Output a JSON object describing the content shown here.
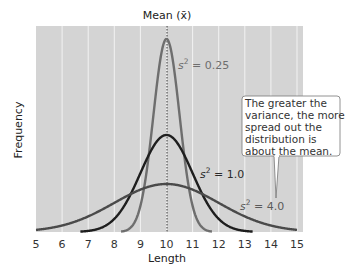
{
  "chart_data": {
    "type": "line",
    "title": "",
    "xlabel": "Length",
    "ylabel": "Frequency",
    "xlim": [
      5,
      15
    ],
    "xticks": [
      5,
      6,
      7,
      8,
      9,
      10,
      11,
      12,
      13,
      14,
      15
    ],
    "grid": {
      "vertical": true,
      "horizontal": false
    },
    "mean_line": {
      "x": 10,
      "label": "Mean (x̄)"
    },
    "series": [
      {
        "name": "s² = 0.25",
        "mean": 10,
        "variance": 0.25,
        "color": "#6e6e6e",
        "label_x": 11.0,
        "label_y_frac": 0.86
      },
      {
        "name": "s² = 1.0",
        "mean": 10,
        "variance": 1.0,
        "color": "#1e1e1e",
        "label_x": 11.7,
        "label_y_frac": 0.32
      },
      {
        "name": "s² = 4.0",
        "mean": 10,
        "variance": 4.0,
        "color": "#4a4a4a",
        "label_x": 13.2,
        "label_y_frac": 0.12
      }
    ],
    "annotations": [
      {
        "text": "The greater the variance, the more spread out the distribution is about the mean.",
        "pointer_to": "s² = 4.0"
      }
    ]
  },
  "labels": {
    "mean": "Mean (x̄)",
    "xlabel": "Length",
    "ylabel": "Frequency",
    "s025_prefix": "s",
    "s025_value": " = 0.25",
    "s1_prefix": "s",
    "s1_value": " = 1.0",
    "s4_prefix": "s",
    "s4_value": " = 4.0",
    "sup": "2",
    "callout_lines": [
      "The greater the",
      "variance, the more",
      "spread out the",
      "distribution is",
      "about the mean."
    ]
  },
  "ticks": [
    "5",
    "6",
    "7",
    "8",
    "9",
    "10",
    "11",
    "12",
    "13",
    "14",
    "15"
  ],
  "colors": {
    "plot_bg": "#d4d4d4",
    "grid": "#f2f2f2",
    "callout_bg": "#ffffff",
    "callout_border": "#777777"
  }
}
